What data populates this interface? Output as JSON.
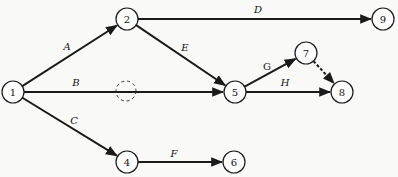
{
  "diagram": {
    "type": "activity-on-arrow network",
    "nodes": [
      {
        "id": "1",
        "label": "1",
        "x": 13,
        "y": 92
      },
      {
        "id": "2",
        "label": "2",
        "x": 127,
        "y": 19
      },
      {
        "id": "4",
        "label": "4",
        "x": 127,
        "y": 162
      },
      {
        "id": "5",
        "label": "5",
        "x": 235,
        "y": 92
      },
      {
        "id": "6",
        "label": "6",
        "x": 234,
        "y": 162
      },
      {
        "id": "7",
        "label": "7",
        "x": 306,
        "y": 53
      },
      {
        "id": "8",
        "label": "8",
        "x": 342,
        "y": 92
      },
      {
        "id": "9",
        "label": "9",
        "x": 383,
        "y": 19
      }
    ],
    "edges": [
      {
        "id": "A",
        "label": "A",
        "from": "1",
        "to": "2",
        "style": "solid",
        "label_x": 67,
        "label_y": 50
      },
      {
        "id": "B",
        "label": "B",
        "from": "1",
        "to": "5",
        "style": "solid",
        "label_x": 76,
        "label_y": 86
      },
      {
        "id": "C",
        "label": "C",
        "from": "1",
        "to": "4",
        "style": "solid",
        "label_x": 74,
        "label_y": 124
      },
      {
        "id": "D",
        "label": "D",
        "from": "2",
        "to": "9",
        "style": "solid",
        "label_x": 258,
        "label_y": 13
      },
      {
        "id": "E",
        "label": "E",
        "from": "2",
        "to": "5",
        "style": "solid",
        "label_x": 185,
        "label_y": 51
      },
      {
        "id": "F",
        "label": "F",
        "from": "4",
        "to": "6",
        "style": "solid",
        "label_x": 174,
        "label_y": 157
      },
      {
        "id": "G",
        "label": "G",
        "from": "5",
        "to": "7",
        "style": "solid",
        "label_x": 267,
        "label_y": 70,
        "upright": true
      },
      {
        "id": "H",
        "label": "H",
        "from": "5",
        "to": "8",
        "style": "solid",
        "label_x": 285,
        "label_y": 86
      },
      {
        "id": "dummy-7-8",
        "label": "",
        "from": "7",
        "to": "8",
        "style": "dashed"
      }
    ],
    "dummy_marker": {
      "x": 126,
      "y": 91,
      "r": 10,
      "on_edge": "B"
    }
  }
}
